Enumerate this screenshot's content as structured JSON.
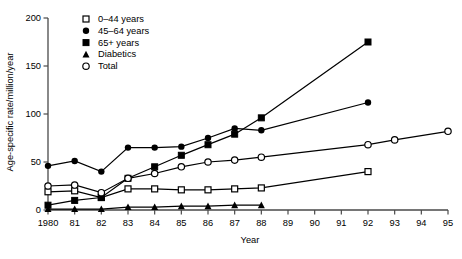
{
  "chart_data": {
    "type": "line",
    "title": "",
    "xlabel": "Year",
    "ylabel": "Age-specific rate/million/year",
    "xlim": [
      1980,
      1995
    ],
    "ylim": [
      0,
      200
    ],
    "grid": false,
    "legend_position": "top-left",
    "x_tick_labels": [
      "1980",
      "81",
      "82",
      "83",
      "84",
      "85",
      "86",
      "87",
      "88",
      "89",
      "90",
      "91",
      "92",
      "93",
      "94",
      "95"
    ],
    "x_ticks": [
      1980,
      1981,
      1982,
      1983,
      1984,
      1985,
      1986,
      1987,
      1988,
      1989,
      1990,
      1991,
      1992,
      1993,
      1994,
      1995
    ],
    "y_ticks": [
      0,
      50,
      100,
      150,
      200
    ],
    "y_tick_labels": [
      "0",
      "50",
      "100",
      "150",
      "200"
    ],
    "series": [
      {
        "name": "0–44 years",
        "marker": "open-square",
        "x": [
          1980,
          1981,
          1982,
          1983,
          1984,
          1985,
          1986,
          1987,
          1988,
          1992
        ],
        "values": [
          19,
          20,
          13,
          22,
          22,
          21,
          21,
          22,
          23,
          40
        ]
      },
      {
        "name": "45–64 years",
        "marker": "filled-circle",
        "x": [
          1980,
          1981,
          1982,
          1983,
          1984,
          1985,
          1986,
          1987,
          1988,
          1992
        ],
        "values": [
          46,
          51,
          40,
          65,
          65,
          66,
          75,
          85,
          83,
          112
        ]
      },
      {
        "name": "65+ years",
        "marker": "filled-square",
        "x": [
          1980,
          1981,
          1982,
          1983,
          1984,
          1985,
          1986,
          1987,
          1988,
          1992
        ],
        "values": [
          5,
          10,
          13,
          33,
          45,
          57,
          68,
          79,
          96,
          175
        ]
      },
      {
        "name": "Diabetics",
        "marker": "filled-triangle",
        "x": [
          1980,
          1981,
          1982,
          1983,
          1984,
          1985,
          1986,
          1987,
          1988
        ],
        "values": [
          1,
          1,
          1,
          3,
          3,
          4,
          4,
          5,
          5
        ]
      },
      {
        "name": "Total",
        "marker": "open-circle",
        "x": [
          1980,
          1981,
          1982,
          1983,
          1984,
          1985,
          1986,
          1987,
          1988,
          1992,
          1993,
          1995
        ],
        "values": [
          25,
          26,
          18,
          33,
          38,
          45,
          50,
          52,
          55,
          68,
          73,
          82
        ]
      }
    ]
  },
  "legend": {
    "items": [
      {
        "label": "0–44 years",
        "marker": "open-square"
      },
      {
        "label": "45–64 years",
        "marker": "filled-circle"
      },
      {
        "label": "65+ years",
        "marker": "filled-square"
      },
      {
        "label": "Diabetics",
        "marker": "filled-triangle"
      },
      {
        "label": "Total",
        "marker": "open-circle"
      }
    ]
  }
}
